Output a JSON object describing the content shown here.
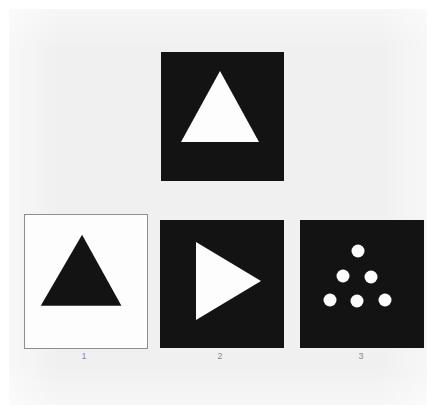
{
  "figure": {
    "kind": "shape-analogy-test-figure",
    "background_color": "#f0f0f0",
    "page_color": "#ffffff",
    "dark_fill": "#131313",
    "light_fill": "#fdfdfd",
    "border_color": "#8d8d8d",
    "label_color": "#8a8a8a"
  },
  "sample": {
    "name": "sample-stimulus",
    "panel_fill": "dark",
    "shape": "triangle-up",
    "shape_fill": "#fdfdfd",
    "shape_count": 1
  },
  "options": [
    {
      "label": "1",
      "panel_fill": "light",
      "shape": "triangle-up",
      "shape_fill": "#131313",
      "shape_count": 1
    },
    {
      "label": "2",
      "panel_fill": "dark",
      "shape": "triangle-right",
      "shape_fill": "#fdfdfd",
      "shape_count": 1
    },
    {
      "label": "3",
      "panel_fill": "dark",
      "shape": "dots-triangular-arrangement",
      "shape_fill": "#fdfdfd",
      "shape_count": 6,
      "dot_rows": [
        1,
        2,
        3
      ]
    }
  ]
}
